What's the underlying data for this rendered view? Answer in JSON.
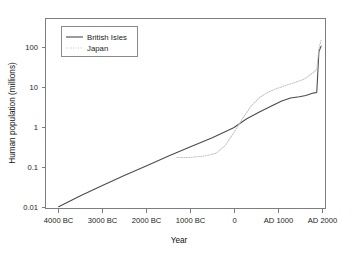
{
  "chart_data": {
    "type": "line",
    "title": "",
    "xlabel": "Year",
    "ylabel": "Human population (millions)",
    "xscale": "linear",
    "yscale": "log",
    "xlim": [
      -4300,
      2100
    ],
    "ylim": [
      0.01,
      300
    ],
    "grid": false,
    "legend_position": "top-left",
    "xticks": [
      -4000,
      -3000,
      -2000,
      -1000,
      0,
      1000,
      2000
    ],
    "xticklabels": [
      "4000 BC",
      "3000 BC",
      "2000 BC",
      "1000 BC",
      "0",
      "AD 1000",
      "AD 2000"
    ],
    "yticks": [
      0.01,
      0.1,
      1,
      10,
      100
    ],
    "yticklabels": [
      "0.01",
      "0.1",
      "1",
      "10",
      "100"
    ],
    "series": [
      {
        "name": "British Isles",
        "style": "solid",
        "color": "#4a4a4a",
        "x": [
          -4000,
          -3500,
          -3000,
          -2500,
          -2000,
          -1500,
          -1000,
          -500,
          0,
          300,
          600,
          900,
          1100,
          1300,
          1500,
          1650,
          1750,
          1800,
          1850,
          1900,
          1950,
          2000
        ],
        "y": [
          0.011,
          0.02,
          0.035,
          0.06,
          0.1,
          0.17,
          0.28,
          0.46,
          0.8,
          1.3,
          1.9,
          2.7,
          3.4,
          4.0,
          4.3,
          4.6,
          5.0,
          5.2,
          5.3,
          5.4,
          50.0,
          67.0
        ]
      },
      {
        "name": "Japan",
        "style": "dotted",
        "color": "#c2c2c2",
        "x": [
          -1300,
          -1000,
          -700,
          -400,
          -200,
          0,
          200,
          400,
          600,
          800,
          1000,
          1200,
          1400,
          1600,
          1700,
          1800,
          1850,
          1900,
          1950,
          2000
        ],
        "y": [
          0.16,
          0.16,
          0.17,
          0.2,
          0.3,
          0.6,
          1.3,
          2.6,
          4.2,
          5.6,
          6.8,
          8.0,
          9.3,
          11.0,
          13.0,
          15.5,
          17.0,
          19.0,
          60.0,
          92.0
        ]
      }
    ],
    "legend_entries": [
      "British Isles",
      "Japan"
    ]
  }
}
